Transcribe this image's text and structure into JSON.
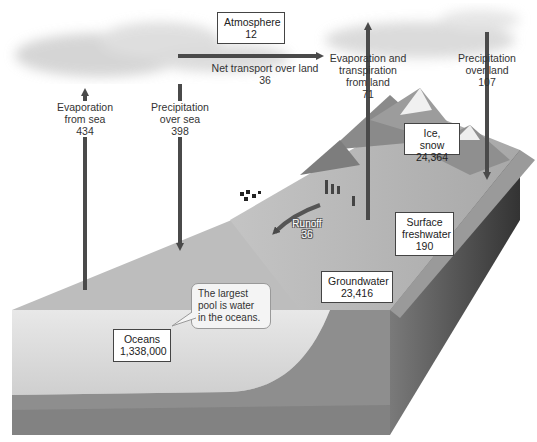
{
  "diagram": {
    "type": "water-cycle",
    "colors": {
      "arrow": "#4a4a4a",
      "cloud": "#cfcfcf",
      "ocean": "#dcdcdc",
      "land": "#b8b8b8",
      "bedrock": "#6a6a6a"
    }
  },
  "pools": {
    "atmosphere": {
      "name": "Atmosphere",
      "value": "12"
    },
    "ice_snow": {
      "name": "Ice, snow",
      "value": "24,364"
    },
    "surface_freshwater": {
      "name_line1": "Surface",
      "name_line2": "freshwater",
      "value": "190"
    },
    "groundwater": {
      "name": "Groundwater",
      "value": "23,416"
    },
    "oceans": {
      "name": "Oceans",
      "value": "1,338,000"
    }
  },
  "fluxes": {
    "evaporation_sea": {
      "line1": "Evaporation",
      "line2": "from sea",
      "value": "434"
    },
    "precipitation_sea": {
      "line1": "Precipitation",
      "line2": "over sea",
      "value": "398"
    },
    "net_transport": {
      "line1": "Net transport over land",
      "value": "36"
    },
    "evapotranspiration_land": {
      "line1": "Evaporation and",
      "line2": "transpiration",
      "line3": "from land",
      "value": "71"
    },
    "precipitation_land": {
      "line1": "Precipitation",
      "line2": "over land",
      "value": "107"
    },
    "runoff": {
      "name": "Runoff",
      "value": "36"
    }
  },
  "callout": {
    "line1": "The largest",
    "line2": "pool is water",
    "line3": "in the oceans."
  }
}
